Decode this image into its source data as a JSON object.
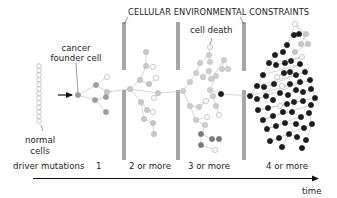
{
  "title": "CELLULAR ENVIRONMENTAL CONSTRAINTS",
  "labels": {
    "cancer_founder_line1": "cancer",
    "cancer_founder_line2": "founder cell",
    "cell_death": "cell death",
    "normal_line1": "normal",
    "normal_line2": "cells",
    "time": "time"
  },
  "axis": {
    "label": "driver mutations",
    "stages": [
      "1",
      "2 or more",
      "3 or more",
      "4 or more"
    ]
  },
  "colors": {
    "barrier": "#a6a6a6",
    "line": "#9a9a9a",
    "stage1_cell": "#9c9c9c",
    "stage2_cell": "#c8c8c8",
    "stage3_cell": "#cfcfcf",
    "stage3_dark": "#7a7a7a",
    "stage4_cell": "#1c1c1c",
    "dead_cell_stroke": "#b5b5b5",
    "text": "#222222"
  },
  "barriers": [
    {
      "x": 124,
      "top": [
        22,
        70
      ],
      "bottom": [
        90,
        160
      ]
    },
    {
      "x": 178,
      "top": [
        22,
        70
      ],
      "bottom": [
        90,
        160
      ]
    },
    {
      "x": 244,
      "top": [
        22,
        71
      ],
      "bottom": [
        90,
        160
      ]
    }
  ],
  "normal_cells": {
    "x": 39,
    "y_start": 66,
    "count": 13,
    "spacing": 4.6
  },
  "cells": [
    {
      "x": 78,
      "y": 95,
      "t": "s1"
    },
    {
      "x": 96,
      "y": 85,
      "t": "s1"
    },
    {
      "x": 107,
      "y": 77,
      "t": "d"
    },
    {
      "x": 107,
      "y": 92,
      "t": "s2"
    },
    {
      "x": 95,
      "y": 100,
      "t": "s1"
    },
    {
      "x": 106,
      "y": 97,
      "t": "s1"
    },
    {
      "x": 106,
      "y": 112,
      "t": "s1"
    },
    {
      "x": 130,
      "y": 89,
      "t": "s2"
    },
    {
      "x": 140,
      "y": 80,
      "t": "s2"
    },
    {
      "x": 146,
      "y": 66,
      "t": "s2"
    },
    {
      "x": 146,
      "y": 52,
      "t": "s2"
    },
    {
      "x": 153,
      "y": 67,
      "t": "d"
    },
    {
      "x": 149,
      "y": 84,
      "t": "s2"
    },
    {
      "x": 156,
      "y": 78,
      "t": "d"
    },
    {
      "x": 158,
      "y": 93,
      "t": "s2"
    },
    {
      "x": 154,
      "y": 98,
      "t": "d"
    },
    {
      "x": 141,
      "y": 102,
      "t": "s2"
    },
    {
      "x": 147,
      "y": 110,
      "t": "s2"
    },
    {
      "x": 153,
      "y": 112,
      "t": "d"
    },
    {
      "x": 144,
      "y": 119,
      "t": "s2"
    },
    {
      "x": 153,
      "y": 123,
      "t": "s2"
    },
    {
      "x": 154,
      "y": 134,
      "t": "s2"
    },
    {
      "x": 183,
      "y": 91,
      "t": "s3"
    },
    {
      "x": 190,
      "y": 82,
      "t": "s3"
    },
    {
      "x": 196,
      "y": 73,
      "t": "s3"
    },
    {
      "x": 200,
      "y": 63,
      "t": "s3"
    },
    {
      "x": 209,
      "y": 55,
      "t": "s3"
    },
    {
      "x": 210,
      "y": 47,
      "t": "d"
    },
    {
      "x": 210,
      "y": 62,
      "t": "s3"
    },
    {
      "x": 203,
      "y": 77,
      "t": "s3"
    },
    {
      "x": 209,
      "y": 71,
      "t": "s3"
    },
    {
      "x": 211,
      "y": 79,
      "t": "s3"
    },
    {
      "x": 224,
      "y": 60,
      "t": "s3"
    },
    {
      "x": 222,
      "y": 69,
      "t": "s3"
    },
    {
      "x": 228,
      "y": 69,
      "t": "s3"
    },
    {
      "x": 216,
      "y": 76,
      "t": "s3"
    },
    {
      "x": 210,
      "y": 90,
      "t": "s3"
    },
    {
      "x": 190,
      "y": 106,
      "t": "s3"
    },
    {
      "x": 199,
      "y": 107,
      "t": "s3"
    },
    {
      "x": 206,
      "y": 101,
      "t": "d"
    },
    {
      "x": 213,
      "y": 96,
      "t": "s3"
    },
    {
      "x": 216,
      "y": 106,
      "t": "s3"
    },
    {
      "x": 219,
      "y": 115,
      "t": "d"
    },
    {
      "x": 196,
      "y": 120,
      "t": "s3"
    },
    {
      "x": 207,
      "y": 117,
      "t": "d"
    },
    {
      "x": 205,
      "y": 125,
      "t": "s3"
    },
    {
      "x": 201,
      "y": 134,
      "t": "sd"
    },
    {
      "x": 201,
      "y": 145,
      "t": "sd"
    },
    {
      "x": 212,
      "y": 139,
      "t": "sd"
    },
    {
      "x": 219,
      "y": 139,
      "t": "sd"
    },
    {
      "x": 215,
      "y": 150,
      "t": "d"
    },
    {
      "x": 221,
      "y": 94,
      "t": "s4"
    },
    {
      "x": 250,
      "y": 96,
      "t": "s4"
    },
    {
      "x": 257,
      "y": 86,
      "t": "s4"
    },
    {
      "x": 263,
      "y": 75,
      "t": "s4"
    },
    {
      "x": 269,
      "y": 63,
      "t": "s4"
    },
    {
      "x": 275,
      "y": 55,
      "t": "s4"
    },
    {
      "x": 283,
      "y": 52,
      "t": "s4"
    },
    {
      "x": 287,
      "y": 45,
      "t": "s4"
    },
    {
      "x": 294,
      "y": 35,
      "t": "s4"
    },
    {
      "x": 299,
      "y": 34,
      "t": "s4"
    },
    {
      "x": 295,
      "y": 24,
      "t": "d"
    },
    {
      "x": 306,
      "y": 34,
      "t": "s2"
    },
    {
      "x": 301,
      "y": 44,
      "t": "s2"
    },
    {
      "x": 308,
      "y": 44,
      "t": "s2"
    },
    {
      "x": 295,
      "y": 52,
      "t": "s2"
    },
    {
      "x": 302,
      "y": 57,
      "t": "d"
    },
    {
      "x": 276,
      "y": 65,
      "t": "s4"
    },
    {
      "x": 285,
      "y": 63,
      "t": "s4"
    },
    {
      "x": 291,
      "y": 61,
      "t": "s4"
    },
    {
      "x": 300,
      "y": 64,
      "t": "s4"
    },
    {
      "x": 277,
      "y": 77,
      "t": "d"
    },
    {
      "x": 284,
      "y": 73,
      "t": "s4"
    },
    {
      "x": 290,
      "y": 72,
      "t": "s4"
    },
    {
      "x": 296,
      "y": 75,
      "t": "s4"
    },
    {
      "x": 305,
      "y": 72,
      "t": "s4"
    },
    {
      "x": 264,
      "y": 87,
      "t": "s4"
    },
    {
      "x": 274,
      "y": 84,
      "t": "s4"
    },
    {
      "x": 282,
      "y": 86,
      "t": "d"
    },
    {
      "x": 290,
      "y": 84,
      "t": "s4"
    },
    {
      "x": 300,
      "y": 82,
      "t": "s4"
    },
    {
      "x": 310,
      "y": 80,
      "t": "s4"
    },
    {
      "x": 257,
      "y": 99,
      "t": "s4"
    },
    {
      "x": 266,
      "y": 96,
      "t": "s4"
    },
    {
      "x": 273,
      "y": 100,
      "t": "s4"
    },
    {
      "x": 280,
      "y": 93,
      "t": "s4"
    },
    {
      "x": 288,
      "y": 95,
      "t": "s4"
    },
    {
      "x": 296,
      "y": 90,
      "t": "s4"
    },
    {
      "x": 303,
      "y": 92,
      "t": "s4"
    },
    {
      "x": 311,
      "y": 89,
      "t": "s4"
    },
    {
      "x": 315,
      "y": 98,
      "t": "s4"
    },
    {
      "x": 258,
      "y": 110,
      "t": "s4"
    },
    {
      "x": 268,
      "y": 108,
      "t": "s4"
    },
    {
      "x": 280,
      "y": 106,
      "t": "d"
    },
    {
      "x": 287,
      "y": 104,
      "t": "s4"
    },
    {
      "x": 294,
      "y": 102,
      "t": "s4"
    },
    {
      "x": 303,
      "y": 101,
      "t": "s4"
    },
    {
      "x": 311,
      "y": 105,
      "t": "s4"
    },
    {
      "x": 263,
      "y": 120,
      "t": "s4"
    },
    {
      "x": 273,
      "y": 116,
      "t": "s4"
    },
    {
      "x": 283,
      "y": 112,
      "t": "s4"
    },
    {
      "x": 292,
      "y": 112,
      "t": "s4"
    },
    {
      "x": 301,
      "y": 117,
      "t": "s4"
    },
    {
      "x": 309,
      "y": 113,
      "t": "s4"
    },
    {
      "x": 267,
      "y": 129,
      "t": "s4"
    },
    {
      "x": 276,
      "y": 126,
      "t": "s4"
    },
    {
      "x": 285,
      "y": 123,
      "t": "s4"
    },
    {
      "x": 296,
      "y": 124,
      "t": "s4"
    },
    {
      "x": 304,
      "y": 128,
      "t": "s4"
    },
    {
      "x": 312,
      "y": 124,
      "t": "s4"
    },
    {
      "x": 270,
      "y": 141,
      "t": "s4"
    },
    {
      "x": 279,
      "y": 138,
      "t": "s4"
    },
    {
      "x": 289,
      "y": 134,
      "t": "s4"
    },
    {
      "x": 297,
      "y": 137,
      "t": "s4"
    },
    {
      "x": 306,
      "y": 140,
      "t": "s4"
    },
    {
      "x": 282,
      "y": 147,
      "t": "s4"
    },
    {
      "x": 302,
      "y": 148,
      "t": "s4"
    }
  ],
  "links": [
    [
      0,
      1
    ],
    [
      1,
      2
    ],
    [
      1,
      3
    ],
    [
      0,
      4
    ],
    [
      4,
      5
    ],
    [
      4,
      6
    ],
    [
      3,
      7
    ],
    [
      7,
      8
    ],
    [
      8,
      9
    ],
    [
      9,
      10
    ],
    [
      9,
      11
    ],
    [
      8,
      12
    ],
    [
      12,
      13
    ],
    [
      7,
      14
    ],
    [
      14,
      15
    ],
    [
      7,
      16
    ],
    [
      16,
      17
    ],
    [
      17,
      18
    ],
    [
      16,
      19
    ],
    [
      19,
      20
    ],
    [
      20,
      21
    ],
    [
      14,
      22
    ],
    [
      22,
      23
    ],
    [
      23,
      24
    ],
    [
      24,
      25
    ],
    [
      25,
      26
    ],
    [
      26,
      27
    ],
    [
      26,
      28
    ],
    [
      24,
      29
    ],
    [
      29,
      30
    ],
    [
      30,
      31
    ],
    [
      31,
      32
    ],
    [
      32,
      33
    ],
    [
      32,
      34
    ],
    [
      31,
      35
    ],
    [
      35,
      36
    ],
    [
      22,
      37
    ],
    [
      37,
      38
    ],
    [
      38,
      39
    ],
    [
      38,
      40
    ],
    [
      40,
      41
    ],
    [
      41,
      42
    ],
    [
      37,
      43
    ],
    [
      43,
      44
    ],
    [
      43,
      45
    ],
    [
      45,
      46
    ],
    [
      46,
      47
    ],
    [
      46,
      48
    ],
    [
      48,
      49
    ],
    [
      47,
      50
    ],
    [
      36,
      51
    ],
    [
      51,
      52
    ],
    [
      52,
      53
    ],
    [
      53,
      54
    ],
    [
      54,
      55
    ],
    [
      55,
      56
    ],
    [
      56,
      57
    ],
    [
      57,
      58
    ],
    [
      58,
      59
    ],
    [
      59,
      60
    ],
    [
      58,
      61
    ],
    [
      61,
      62
    ],
    [
      62,
      63
    ],
    [
      61,
      64
    ],
    [
      64,
      65
    ],
    [
      55,
      66
    ],
    [
      66,
      67
    ],
    [
      67,
      68
    ],
    [
      68,
      69
    ],
    [
      54,
      70
    ],
    [
      70,
      71
    ],
    [
      71,
      72
    ],
    [
      72,
      73
    ],
    [
      73,
      74
    ],
    [
      53,
      75
    ],
    [
      75,
      76
    ],
    [
      76,
      77
    ],
    [
      77,
      78
    ],
    [
      78,
      79
    ],
    [
      79,
      80
    ],
    [
      52,
      81
    ],
    [
      81,
      82
    ],
    [
      82,
      83
    ],
    [
      83,
      84
    ],
    [
      84,
      85
    ],
    [
      85,
      86
    ],
    [
      86,
      87
    ],
    [
      87,
      88
    ],
    [
      88,
      89
    ],
    [
      81,
      90
    ],
    [
      90,
      91
    ],
    [
      91,
      92
    ],
    [
      92,
      93
    ],
    [
      93,
      94
    ],
    [
      94,
      95
    ],
    [
      95,
      96
    ],
    [
      90,
      97
    ],
    [
      97,
      98
    ],
    [
      98,
      99
    ],
    [
      99,
      100
    ],
    [
      100,
      101
    ],
    [
      101,
      102
    ],
    [
      97,
      103
    ],
    [
      103,
      104
    ],
    [
      104,
      105
    ],
    [
      105,
      106
    ],
    [
      106,
      107
    ],
    [
      107,
      108
    ],
    [
      103,
      109
    ],
    [
      109,
      110
    ],
    [
      110,
      111
    ],
    [
      111,
      112
    ],
    [
      112,
      113
    ],
    [
      109,
      114
    ],
    [
      112,
      115
    ]
  ]
}
